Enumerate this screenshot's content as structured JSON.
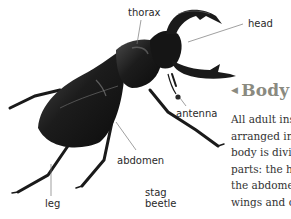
{
  "diagram": {
    "subject": "stag beetle",
    "labels": {
      "thorax": "thorax",
      "head": "head",
      "antenna": "antenna",
      "abdomen": "abdomen",
      "leg": "leg",
      "caption_line1": "stag",
      "caption_line2": "beetle"
    }
  },
  "section": {
    "heading": "Body",
    "heading_arrow": "◀",
    "text_lines": [
      "All adult ins",
      "arranged in",
      "body is divid",
      "parts: the he",
      "the abdome",
      "wings and c"
    ]
  },
  "colors": {
    "beetle_body": "#1a1a1a",
    "beetle_highlight": "#5a5a5a",
    "label_text": "#2a2a2a",
    "heading": "#8a8a80",
    "leader_line": "#777777"
  }
}
